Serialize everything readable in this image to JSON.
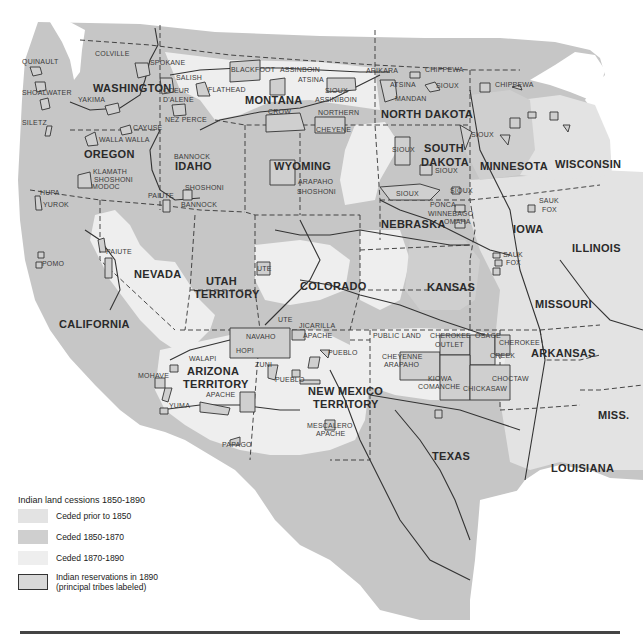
{
  "legend": {
    "title": "Indian land cessions  1850-1890",
    "items": [
      {
        "label": "Ceded prior to 1850",
        "color": "#e3e3e3"
      },
      {
        "label": "Ceded 1850-1870",
        "color": "#cfcfcf"
      },
      {
        "label": "Ceded 1870-1890",
        "color": "#eeeeee"
      },
      {
        "label": "Indian reservations in 1890",
        "label2": "(principal tribes labeled)",
        "color": "#d8d8d8",
        "border": "#333333"
      }
    ]
  },
  "colors": {
    "base_land": "#c6c6c6",
    "ceded_prior_1850": "#e3e3e3",
    "ceded_1850_1870": "#cfcfcf",
    "ceded_1870_1890": "#eeeeee",
    "water": "#ffffff",
    "border_line": "#333333"
  },
  "states": [
    {
      "name": "WASHINGTON",
      "x": 93,
      "y": 92
    },
    {
      "name": "OREGON",
      "x": 84,
      "y": 158
    },
    {
      "name": "IDAHO",
      "x": 175,
      "y": 170
    },
    {
      "name": "MONTANA",
      "x": 245,
      "y": 104
    },
    {
      "name": "WYOMING",
      "x": 274,
      "y": 170
    },
    {
      "name": "NORTH DAKOTA",
      "x": 381,
      "y": 118
    },
    {
      "name": "SOUTH",
      "x": 424,
      "y": 152
    },
    {
      "name": "DAKOTA",
      "x": 421,
      "y": 166
    },
    {
      "name": "MINNESOTA",
      "x": 480,
      "y": 170
    },
    {
      "name": "WISCONSIN",
      "x": 555,
      "y": 168
    },
    {
      "name": "NEBRASKA",
      "x": 381,
      "y": 228
    },
    {
      "name": "IOWA",
      "x": 513,
      "y": 233
    },
    {
      "name": "ILLINOIS",
      "x": 572,
      "y": 252
    },
    {
      "name": "NEVADA",
      "x": 134,
      "y": 278
    },
    {
      "name": "UTAH",
      "x": 206,
      "y": 285
    },
    {
      "name": "TERRITORY",
      "x": 194,
      "y": 298
    },
    {
      "name": "COLORADO",
      "x": 300,
      "y": 290
    },
    {
      "name": "KANSAS",
      "x": 427,
      "y": 291
    },
    {
      "name": "MISSOURI",
      "x": 535,
      "y": 308
    },
    {
      "name": "CALIFORNIA",
      "x": 59,
      "y": 328
    },
    {
      "name": "ARIZONA",
      "x": 187,
      "y": 375
    },
    {
      "name": "TERRITORY",
      "x": 183,
      "y": 388
    },
    {
      "name": "NEW MEXICO",
      "x": 308,
      "y": 395
    },
    {
      "name": "TERRITORY",
      "x": 313,
      "y": 408
    },
    {
      "name": "ARKANSAS",
      "x": 531,
      "y": 357
    },
    {
      "name": "TEXAS",
      "x": 432,
      "y": 460
    },
    {
      "name": "MISS.",
      "x": 598,
      "y": 419
    },
    {
      "name": "LOUISIANA",
      "x": 551,
      "y": 472
    }
  ],
  "tribes": [
    {
      "name": "COLVILLE",
      "x": 95,
      "y": 56
    },
    {
      "name": "QUINAULT",
      "x": 22,
      "y": 64
    },
    {
      "name": "SPOKANE",
      "x": 150,
      "y": 65
    },
    {
      "name": "SALISH",
      "x": 176,
      "y": 80
    },
    {
      "name": "BLACKFOOT",
      "x": 231,
      "y": 72
    },
    {
      "name": "ASSINBOIN",
      "x": 280,
      "y": 72
    },
    {
      "name": "ATSINA",
      "x": 298,
      "y": 82
    },
    {
      "name": "ARIKARA",
      "x": 366,
      "y": 73
    },
    {
      "name": "CHIPPEWA",
      "x": 425,
      "y": 72
    },
    {
      "name": "CHIPPEWA",
      "x": 495,
      "y": 87
    },
    {
      "name": "ATSINA",
      "x": 390,
      "y": 87
    },
    {
      "name": "SIOUX",
      "x": 436,
      "y": 88
    },
    {
      "name": "SHOALWATER",
      "x": 22,
      "y": 95
    },
    {
      "name": "YAKIMA",
      "x": 78,
      "y": 102
    },
    {
      "name": "COEUR",
      "x": 163,
      "y": 93
    },
    {
      "name": "D'ALENE",
      "x": 163,
      "y": 102
    },
    {
      "name": "FLATHEAD",
      "x": 208,
      "y": 92
    },
    {
      "name": "SIOUX",
      "x": 325,
      "y": 93
    },
    {
      "name": "ASSINIBOIN",
      "x": 315,
      "y": 102
    },
    {
      "name": "MANDAN",
      "x": 395,
      "y": 101
    },
    {
      "name": "SILETZ",
      "x": 22,
      "y": 125
    },
    {
      "name": "NEZ PERCE",
      "x": 165,
      "y": 122
    },
    {
      "name": "CAYUSE",
      "x": 133,
      "y": 130
    },
    {
      "name": "CROW",
      "x": 268,
      "y": 114
    },
    {
      "name": "NORTHERN",
      "x": 318,
      "y": 115
    },
    {
      "name": "WALLA WALLA",
      "x": 99,
      "y": 142
    },
    {
      "name": "CHEYENE",
      "x": 316,
      "y": 132
    },
    {
      "name": "SIOUX",
      "x": 471,
      "y": 137
    },
    {
      "name": "BANNOCK",
      "x": 174,
      "y": 159
    },
    {
      "name": "SIOUX",
      "x": 392,
      "y": 152
    },
    {
      "name": "SIOUX",
      "x": 435,
      "y": 173
    },
    {
      "name": "ARAPAHO",
      "x": 298,
      "y": 184
    },
    {
      "name": "SHOSHONI",
      "x": 297,
      "y": 194
    },
    {
      "name": "KLAMATH",
      "x": 93,
      "y": 174
    },
    {
      "name": "SHOSHONI",
      "x": 94,
      "y": 182
    },
    {
      "name": "MODOC",
      "x": 92,
      "y": 189
    },
    {
      "name": "SHOSHONI",
      "x": 185,
      "y": 190
    },
    {
      "name": "SIOUX",
      "x": 396,
      "y": 196
    },
    {
      "name": "SIOUX",
      "x": 450,
      "y": 193
    },
    {
      "name": "HUPA",
      "x": 40,
      "y": 195
    },
    {
      "name": "PAIUTE",
      "x": 148,
      "y": 198
    },
    {
      "name": "BANNOCK",
      "x": 181,
      "y": 207
    },
    {
      "name": "PONCA",
      "x": 430,
      "y": 207
    },
    {
      "name": "YUROK",
      "x": 43,
      "y": 207
    },
    {
      "name": "WINNEBAGO",
      "x": 428,
      "y": 216
    },
    {
      "name": "OMAHA",
      "x": 444,
      "y": 224
    },
    {
      "name": "SAUK",
      "x": 539,
      "y": 203
    },
    {
      "name": "FOX",
      "x": 542,
      "y": 212
    },
    {
      "name": "PAIUTE",
      "x": 106,
      "y": 254
    },
    {
      "name": "POMO",
      "x": 42,
      "y": 266
    },
    {
      "name": "UTE",
      "x": 257,
      "y": 271
    },
    {
      "name": "SAUK",
      "x": 503,
      "y": 257
    },
    {
      "name": "FOX",
      "x": 506,
      "y": 265
    },
    {
      "name": "UTE",
      "x": 278,
      "y": 322
    },
    {
      "name": "JICARILLA",
      "x": 299,
      "y": 328
    },
    {
      "name": "PUBLIC LAND",
      "x": 373,
      "y": 338
    },
    {
      "name": "CHEROKEE",
      "x": 430,
      "y": 338
    },
    {
      "name": "OSAGE",
      "x": 475,
      "y": 338
    },
    {
      "name": "NAVAHO",
      "x": 246,
      "y": 339
    },
    {
      "name": "APACHE",
      "x": 303,
      "y": 338
    },
    {
      "name": "OUTLET",
      "x": 435,
      "y": 347
    },
    {
      "name": "CHEROKEE",
      "x": 499,
      "y": 345
    },
    {
      "name": "HOPI",
      "x": 236,
      "y": 353
    },
    {
      "name": "PUEBLO",
      "x": 328,
      "y": 355
    },
    {
      "name": "WALAPI",
      "x": 189,
      "y": 361
    },
    {
      "name": "CREEK",
      "x": 490,
      "y": 358
    },
    {
      "name": "CHEYENNE",
      "x": 382,
      "y": 359
    },
    {
      "name": "ARAPAHO",
      "x": 384,
      "y": 367
    },
    {
      "name": "ZUNI",
      "x": 255,
      "y": 367
    },
    {
      "name": "PUEBLO",
      "x": 275,
      "y": 382
    },
    {
      "name": "KIOWA",
      "x": 428,
      "y": 381
    },
    {
      "name": "CHOCTAW",
      "x": 492,
      "y": 381
    },
    {
      "name": "COMANCHE",
      "x": 418,
      "y": 389
    },
    {
      "name": "CHICKASAW",
      "x": 463,
      "y": 391
    },
    {
      "name": "MOHAVE",
      "x": 138,
      "y": 378
    },
    {
      "name": "APACHE",
      "x": 206,
      "y": 397
    },
    {
      "name": "YUMA",
      "x": 169,
      "y": 408
    },
    {
      "name": "MESCALERO",
      "x": 307,
      "y": 428
    },
    {
      "name": "APACHE",
      "x": 316,
      "y": 436
    },
    {
      "name": "PAPAGO",
      "x": 222,
      "y": 447
    }
  ]
}
